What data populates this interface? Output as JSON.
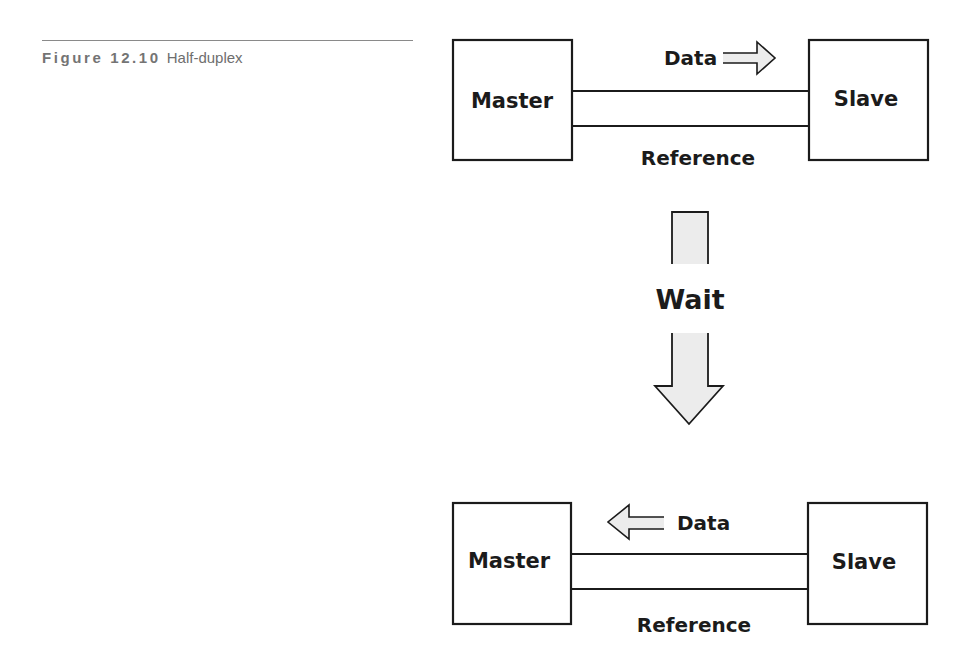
{
  "caption": {
    "figure_label": "Figure 12.10",
    "title": "Half-duplex"
  },
  "phase1": {
    "master_label": "Master",
    "slave_label": "Slave",
    "data_label": "Data",
    "data_direction": "master-to-slave",
    "reference_label": "Reference"
  },
  "transition": {
    "label": "Wait"
  },
  "phase2": {
    "master_label": "Master",
    "slave_label": "Slave",
    "data_label": "Data",
    "data_direction": "slave-to-master",
    "reference_label": "Reference"
  },
  "colors": {
    "stroke": "#1b1b1b",
    "arrow_fill": "#ececec",
    "caption_text": "#6e6e6e",
    "rule": "#8a8a8a"
  }
}
